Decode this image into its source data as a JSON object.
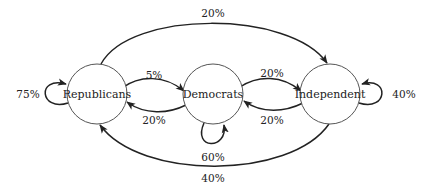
{
  "diagram": {
    "type": "state-transition",
    "nodes": [
      {
        "id": "R",
        "label": "Republicans",
        "cx": 97,
        "cy": 94,
        "r": 30
      },
      {
        "id": "D",
        "label": "Democrats",
        "cx": 213,
        "cy": 94,
        "r": 30
      },
      {
        "id": "I",
        "label": "Independent",
        "cx": 330,
        "cy": 94,
        "r": 30
      }
    ],
    "edges": [
      {
        "from": "R",
        "to": "R",
        "label": "75%"
      },
      {
        "from": "R",
        "to": "D",
        "label": "5%"
      },
      {
        "from": "D",
        "to": "R",
        "label": "20%"
      },
      {
        "from": "R",
        "to": "I",
        "label": "20%"
      },
      {
        "from": "D",
        "to": "D",
        "label": "60%"
      },
      {
        "from": "D",
        "to": "I",
        "label": "20%"
      },
      {
        "from": "I",
        "to": "D",
        "label": "20%"
      },
      {
        "from": "I",
        "to": "I",
        "label": "40%"
      },
      {
        "from": "I",
        "to": "R",
        "label": "40%"
      }
    ],
    "colors": {
      "node_stroke": "#555555",
      "edge_stroke": "#222222",
      "text": "#222222",
      "background": "#ffffff"
    }
  }
}
